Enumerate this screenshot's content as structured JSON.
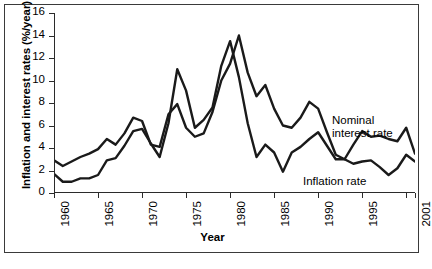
{
  "figure": {
    "xlabel": "Year",
    "ylabel": "Inflation and interest rates (%/year)",
    "note_nominal_line1": "Nominal",
    "note_nominal_line2": "interest rate",
    "note_inflation": "Inflation rate"
  },
  "chart_data": {
    "type": "line",
    "title": "",
    "xlabel": "Year",
    "ylabel": "Inflation and interest rates (%/year)",
    "xlim": [
      1960,
      2001
    ],
    "ylim": [
      0,
      16
    ],
    "ytick_values": [
      0,
      2,
      4,
      6,
      8,
      10,
      12,
      14,
      16
    ],
    "ytick_labels": [
      "0",
      "2",
      "4",
      "6",
      "8",
      "10",
      "12",
      "14",
      "16"
    ],
    "xtick_values": [
      1960,
      1965,
      1970,
      1975,
      1980,
      1985,
      1990,
      1995,
      2001
    ],
    "xtick_labels": [
      "1960",
      "1965",
      "1970",
      "1975",
      "1980",
      "1985",
      "1990",
      "1995",
      "2001"
    ],
    "xtick_minor_values": [
      2000
    ],
    "grid": false,
    "legend": "inline-annotations",
    "legend_position": "inside-right",
    "x": [
      1960,
      1961,
      1962,
      1963,
      1964,
      1965,
      1966,
      1967,
      1968,
      1969,
      1970,
      1971,
      1972,
      1973,
      1974,
      1975,
      1976,
      1977,
      1978,
      1979,
      1980,
      1981,
      1982,
      1983,
      1984,
      1985,
      1986,
      1987,
      1988,
      1989,
      1990,
      1991,
      1992,
      1993,
      1994,
      1995,
      1996,
      1997,
      1998,
      1999,
      2000,
      2001
    ],
    "series": [
      {
        "name": "Nominal interest rate",
        "values": [
          2.9,
          2.4,
          2.8,
          3.2,
          3.5,
          3.9,
          4.8,
          4.3,
          5.3,
          6.7,
          6.4,
          4.3,
          4.1,
          7.0,
          7.9,
          5.8,
          5.0,
          5.3,
          7.2,
          10.0,
          11.5,
          14.0,
          10.7,
          8.6,
          9.6,
          7.5,
          6.0,
          5.8,
          6.7,
          8.1,
          7.5,
          5.4,
          3.4,
          3.0,
          4.3,
          5.5,
          5.0,
          5.1,
          4.8,
          4.6,
          5.8,
          3.5
        ]
      },
      {
        "name": "Inflation rate",
        "values": [
          1.7,
          1.0,
          1.0,
          1.3,
          1.3,
          1.6,
          2.9,
          3.1,
          4.2,
          5.5,
          5.7,
          4.4,
          3.2,
          6.2,
          11.0,
          9.1,
          5.8,
          6.5,
          7.6,
          11.3,
          13.5,
          10.3,
          6.2,
          3.2,
          4.3,
          3.6,
          1.9,
          3.6,
          4.1,
          4.8,
          5.4,
          4.2,
          3.0,
          3.0,
          2.6,
          2.8,
          2.9,
          2.3,
          1.6,
          2.2,
          3.4,
          2.8
        ]
      }
    ]
  }
}
